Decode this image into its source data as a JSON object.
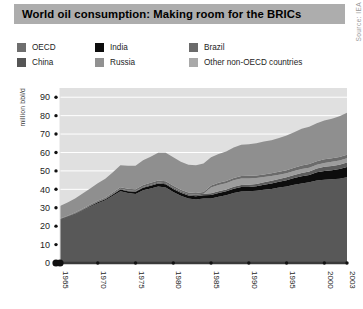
{
  "header": {
    "title": "World oil consumption: Making room for the BRICs",
    "title_bar_color": "#adadad",
    "source": "Source: IEA"
  },
  "legend": {
    "items": [
      {
        "label": "OECD",
        "color": "#6e6e6e",
        "col": 0,
        "row": 0
      },
      {
        "label": "China",
        "color": "#555555",
        "col": 0,
        "row": 1
      },
      {
        "label": "India",
        "color": "#0d0d0d",
        "col": 1,
        "row": 0
      },
      {
        "label": "Russia",
        "color": "#919191",
        "col": 1,
        "row": 1
      },
      {
        "label": "Brazil",
        "color": "#6b6b6b",
        "col": 2,
        "row": 0
      },
      {
        "label": "Other non-OECD countries",
        "color": "#a9a9a9",
        "col": 2,
        "row": 1
      }
    ]
  },
  "chart_data": {
    "type": "area",
    "stacked": true,
    "title": "World oil consumption: Making room for the BRICs",
    "subtitle": "",
    "xlabel": "",
    "ylabel": "million bbl/d",
    "ylim": [
      0,
      95
    ],
    "yticks": [
      0,
      10,
      20,
      30,
      40,
      50,
      60,
      70,
      80,
      90
    ],
    "xlim": [
      1965,
      2003
    ],
    "xticks": [
      1965,
      1970,
      1975,
      1980,
      1985,
      1990,
      1995,
      2000,
      2003
    ],
    "xtick_labels": [
      "1965",
      "1970",
      "1975",
      "1980",
      "1985",
      "1990",
      "1995",
      "2000",
      "2003"
    ],
    "grid": "horizontal",
    "grid_color": "#ffffff",
    "plot_bg": "#e0e0e0",
    "legend_position": "top",
    "x": [
      1965,
      1966,
      1967,
      1968,
      1969,
      1970,
      1971,
      1972,
      1973,
      1974,
      1975,
      1976,
      1977,
      1978,
      1979,
      1980,
      1981,
      1982,
      1983,
      1984,
      1985,
      1986,
      1987,
      1988,
      1989,
      1990,
      1991,
      1992,
      1993,
      1994,
      1995,
      1996,
      1997,
      1998,
      1999,
      2000,
      2001,
      2002,
      2003
    ],
    "series": [
      {
        "name": "OECD",
        "color": "#585858",
        "values": [
          23.5,
          25.0,
          26.5,
          28.5,
          30.5,
          32.5,
          34.0,
          36.5,
          39.0,
          38.0,
          37.5,
          39.5,
          40.5,
          41.5,
          41.0,
          38.5,
          36.5,
          35.0,
          34.5,
          35.0,
          35.0,
          36.0,
          36.8,
          38.0,
          38.8,
          39.0,
          39.2,
          39.8,
          40.2,
          41.0,
          41.5,
          42.5,
          43.2,
          43.8,
          44.8,
          45.2,
          45.5,
          45.8,
          46.5
        ]
      },
      {
        "name": "China",
        "color": "#0d0d0d",
        "values": [
          0.2,
          0.2,
          0.3,
          0.3,
          0.4,
          0.5,
          0.6,
          0.7,
          0.9,
          1.0,
          1.2,
          1.3,
          1.5,
          1.6,
          1.7,
          1.7,
          1.6,
          1.6,
          1.7,
          1.8,
          1.9,
          2.0,
          2.1,
          2.3,
          2.4,
          2.3,
          2.5,
          2.7,
          3.0,
          3.1,
          3.4,
          3.6,
          3.9,
          4.0,
          4.4,
          4.8,
          4.9,
          5.2,
          5.6
        ]
      },
      {
        "name": "India",
        "color": "#5c5c5c",
        "values": [
          0.2,
          0.2,
          0.2,
          0.3,
          0.3,
          0.3,
          0.4,
          0.4,
          0.4,
          0.4,
          0.4,
          0.5,
          0.5,
          0.6,
          0.6,
          0.6,
          0.7,
          0.7,
          0.8,
          0.8,
          0.9,
          1.0,
          1.0,
          1.1,
          1.2,
          1.2,
          1.2,
          1.3,
          1.4,
          1.5,
          1.6,
          1.7,
          1.8,
          1.9,
          2.1,
          2.2,
          2.3,
          2.4,
          2.4
        ]
      },
      {
        "name": "Russia",
        "color": "#9c9c9c",
        "values": [
          0,
          0,
          0,
          0,
          0,
          0,
          0,
          0,
          0,
          0,
          0,
          0,
          0,
          0,
          0,
          0,
          0,
          0,
          0,
          0,
          3.2,
          3.3,
          3.4,
          3.5,
          3.5,
          3.4,
          3.2,
          2.9,
          2.6,
          2.3,
          2.2,
          2.1,
          2.1,
          2.0,
          2.0,
          2.1,
          2.2,
          2.3,
          2.4
        ]
      },
      {
        "name": "Brazil",
        "color": "#6b6b6b",
        "values": [
          0.3,
          0.3,
          0.4,
          0.4,
          0.5,
          0.5,
          0.6,
          0.7,
          0.8,
          0.9,
          0.9,
          1.0,
          1.0,
          1.1,
          1.1,
          1.1,
          1.0,
          1.0,
          1.0,
          1.0,
          1.1,
          1.2,
          1.2,
          1.3,
          1.3,
          1.4,
          1.4,
          1.4,
          1.5,
          1.6,
          1.7,
          1.8,
          1.9,
          2.0,
          2.0,
          2.0,
          1.9,
          1.9,
          1.9
        ]
      },
      {
        "name": "Other non-OECD countries",
        "color": "#8f8f8f",
        "values": [
          6.8,
          7.2,
          7.6,
          8.2,
          8.8,
          9.5,
          10.2,
          11.0,
          12.0,
          12.5,
          12.8,
          13.5,
          14.2,
          15.0,
          15.5,
          15.5,
          15.2,
          15.0,
          15.0,
          15.4,
          15.3,
          15.7,
          16.0,
          16.5,
          17.0,
          17.2,
          17.5,
          17.8,
          18.0,
          18.4,
          18.8,
          19.3,
          20.0,
          20.3,
          20.5,
          21.0,
          21.5,
          22.0,
          22.7
        ]
      }
    ]
  }
}
